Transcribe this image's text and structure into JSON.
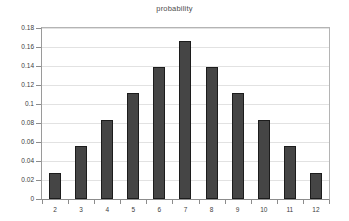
{
  "chart_data": {
    "type": "bar",
    "title": "probability",
    "xlabel": "",
    "ylabel": "",
    "categories": [
      "2",
      "3",
      "4",
      "5",
      "6",
      "7",
      "8",
      "9",
      "10",
      "11",
      "12"
    ],
    "values": [
      0.0278,
      0.0556,
      0.0833,
      0.1111,
      0.1389,
      0.1667,
      0.1389,
      0.1111,
      0.0833,
      0.0556,
      0.0278
    ],
    "ylim": [
      0,
      0.18
    ],
    "ytick_step": 0.02,
    "ytick_labels": [
      "0",
      "0.02",
      "0.04",
      "0.06",
      "0.08",
      "0.1",
      "0.12",
      "0.14",
      "0.16",
      "0.18"
    ],
    "ytick_values": [
      0,
      0.02,
      0.04,
      0.06,
      0.08,
      0.1,
      0.12,
      0.14,
      0.16,
      0.18
    ],
    "grid": true,
    "grid_axis": "y",
    "legend": false,
    "legend_position": "none",
    "bar_color": "#454545",
    "bar_border_color": "#1c1c1c",
    "gridline_color": "#e2e2e2",
    "axis_color": "#8c8c8c",
    "background_color": "#ffffff"
  }
}
